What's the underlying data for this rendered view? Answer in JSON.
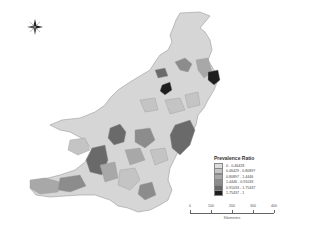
{
  "map": {
    "title": "",
    "region": "Pakistan districts",
    "compass": {
      "icon": "north-arrow-icon"
    }
  },
  "legend": {
    "title": "Prevalence Ratio",
    "items": [
      {
        "label": "0 - 0.46428",
        "color": "#dcdcdc"
      },
      {
        "label": "0.46429 - 0.80897",
        "color": "#c4c4c4"
      },
      {
        "label": "0.80897 - 1.4446",
        "color": "#a8a8a8"
      },
      {
        "label": "1.4446 - 0.91033",
        "color": "#8c8c8c"
      },
      {
        "label": "0.91033 - 1.75437",
        "color": "#6a6a6a"
      },
      {
        "label": "1.75437 - 1",
        "color": "#1e1e1e"
      }
    ]
  },
  "scale_bar": {
    "ticks": [
      "0",
      "100",
      "200",
      "300",
      "400"
    ],
    "unit": "Kilometers"
  }
}
